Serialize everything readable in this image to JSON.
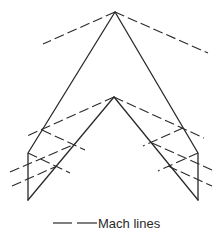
{
  "legend": {
    "label": "Mach lines",
    "line_style": "dashed"
  },
  "colors": {
    "stroke": "#2a2a2a",
    "background": "#ffffff"
  }
}
